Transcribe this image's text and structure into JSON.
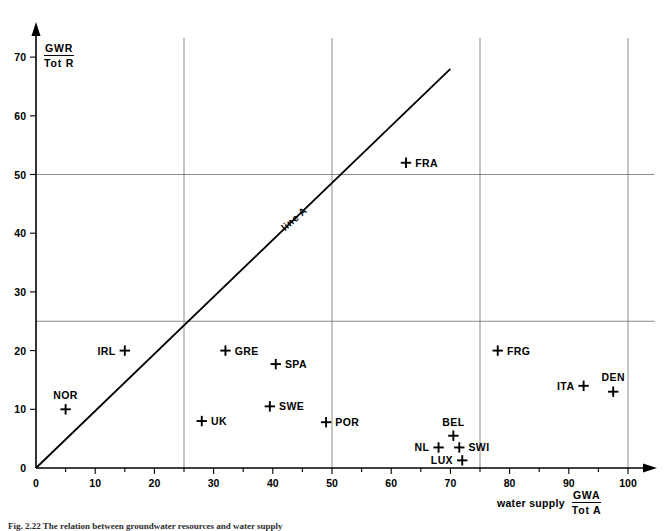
{
  "figure": {
    "caption": "Fig. 2.22   The relation between groundwater resources and water supply",
    "line_label": "line A"
  },
  "axes": {
    "x": {
      "label_text": "water supply",
      "label_numerator": "GWA",
      "label_denominator": "Tot A",
      "ticks": [
        0,
        10,
        20,
        30,
        40,
        50,
        60,
        70,
        80,
        90,
        100
      ],
      "minor_ticks": [
        5,
        15,
        25,
        35,
        45,
        55,
        65,
        75,
        85,
        95
      ],
      "range": [
        0,
        104
      ],
      "gridlines": [
        25,
        50,
        75,
        100
      ]
    },
    "y": {
      "label_numerator": "GWR",
      "label_denominator": "Tot  R",
      "ticks": [
        0,
        10,
        20,
        30,
        40,
        50,
        60,
        70
      ],
      "range": [
        0,
        76
      ],
      "gridlines": [
        25,
        50
      ]
    }
  },
  "chart_data": {
    "type": "scatter",
    "title": "",
    "xlabel": "water supply GWA / Tot A",
    "ylabel": "GWR / Tot R",
    "xlim": [
      0,
      104
    ],
    "ylim": [
      0,
      76
    ],
    "grid": true,
    "legend": "none",
    "marker": "plus",
    "annotations": [
      {
        "text": "line A",
        "type": "line-label",
        "x": 44,
        "y": 42,
        "rotation": -41
      }
    ],
    "reference_line": {
      "name": "line A",
      "from": [
        0,
        0
      ],
      "to": [
        70,
        68
      ],
      "description": "diagonal 1:1 reference line"
    },
    "points": [
      {
        "label": "NOR",
        "x": 5,
        "y": 10,
        "label_pos": "above"
      },
      {
        "label": "IRL",
        "x": 15,
        "y": 20,
        "label_pos": "left"
      },
      {
        "label": "UK",
        "x": 28,
        "y": 8,
        "label_pos": "right"
      },
      {
        "label": "GRE",
        "x": 32,
        "y": 20,
        "label_pos": "right"
      },
      {
        "label": "SPA",
        "x": 40.5,
        "y": 17.7,
        "label_pos": "right"
      },
      {
        "label": "SWE",
        "x": 39.5,
        "y": 10.5,
        "label_pos": "right"
      },
      {
        "label": "POR",
        "x": 49,
        "y": 7.8,
        "label_pos": "right"
      },
      {
        "label": "FRA",
        "x": 62.5,
        "y": 52,
        "label_pos": "right"
      },
      {
        "label": "NL",
        "x": 68,
        "y": 3.5,
        "label_pos": "left"
      },
      {
        "label": "BEL",
        "x": 70.5,
        "y": 5.5,
        "label_pos": "above"
      },
      {
        "label": "SWI",
        "x": 71.5,
        "y": 3.5,
        "label_pos": "right"
      },
      {
        "label": "LUX",
        "x": 72,
        "y": 1.3,
        "label_pos": "left"
      },
      {
        "label": "FRG",
        "x": 78,
        "y": 20,
        "label_pos": "right"
      },
      {
        "label": "ITA",
        "x": 92.5,
        "y": 14,
        "label_pos": "left"
      },
      {
        "label": "DEN",
        "x": 97.5,
        "y": 13,
        "label_pos": "above"
      }
    ]
  },
  "colors": {
    "ink": "#000000",
    "grid": "#7e7e7e",
    "background": "#ffffff"
  }
}
